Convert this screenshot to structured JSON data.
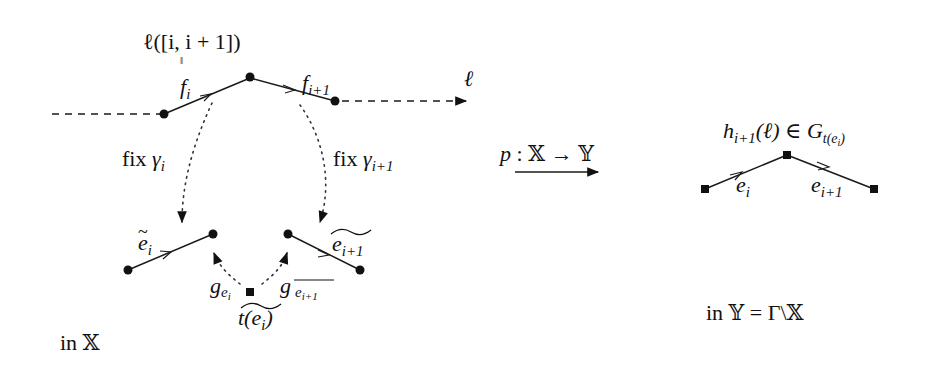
{
  "figure": {
    "left_panel": {
      "top_label": "ℓ([i, i + 1])",
      "equals_sign": "‖",
      "edge_f_i": {
        "base": "f",
        "sub": "i"
      },
      "edge_f_i1": {
        "base": "f",
        "sub": "i+1"
      },
      "line_label": "ℓ",
      "fix_left": {
        "prefix": "fix ",
        "base": "γ",
        "sub": "i"
      },
      "fix_right": {
        "prefix": "fix ",
        "base": "γ",
        "sub": "i+1"
      },
      "edge_e_tilde_i": {
        "base": "e",
        "sub": "i",
        "tilde": "~"
      },
      "edge_e_tilde_i1": {
        "base": "e",
        "sub": "i+1",
        "tilde": "~"
      },
      "g_left": {
        "base": "g",
        "sub": "e",
        "subsub": "i"
      },
      "g_right": {
        "base": "g",
        "sub": "e",
        "subsub": "i+1"
      },
      "vertex_label": {
        "base": "t(e",
        "sub": "i",
        "close": ")",
        "tilde": "~"
      },
      "caption": "in 𝕏"
    },
    "map": {
      "label_p": "p",
      "label_rest": " : 𝕏 → 𝕐"
    },
    "right_panel": {
      "top_label_h": "h",
      "top_label_h_sub": "i+1",
      "top_label_rest": "(ℓ) ∈ G",
      "top_label_G_sub": "t(e",
      "top_label_G_subsub": "i",
      "top_label_G_close": ")",
      "edge_e_i": {
        "base": "e",
        "sub": "i"
      },
      "edge_e_i1": {
        "base": "e",
        "sub": "i+1"
      },
      "caption": "in 𝕐 = Γ\\𝕏"
    },
    "colors": {
      "ink": "#111111",
      "background": "#ffffff"
    }
  }
}
